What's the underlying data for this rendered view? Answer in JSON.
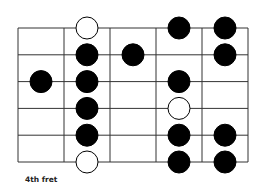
{
  "diagram": {
    "type": "guitar-scale-fretboard",
    "position_label": "4th fret",
    "strings": 6,
    "frets": 5,
    "colors": {
      "line": "#333333",
      "filled": "#000000",
      "open_fill": "#ffffff"
    },
    "dots": [
      {
        "string": 0,
        "fret": 1,
        "style": "open"
      },
      {
        "string": 0,
        "fret": 3,
        "style": "filled"
      },
      {
        "string": 0,
        "fret": 4,
        "style": "filled"
      },
      {
        "string": 1,
        "fret": 1,
        "style": "filled"
      },
      {
        "string": 1,
        "fret": 2,
        "style": "filled"
      },
      {
        "string": 1,
        "fret": 4,
        "style": "filled"
      },
      {
        "string": 2,
        "fret": 0,
        "style": "filled"
      },
      {
        "string": 2,
        "fret": 1,
        "style": "filled"
      },
      {
        "string": 2,
        "fret": 3,
        "style": "filled"
      },
      {
        "string": 3,
        "fret": 1,
        "style": "filled"
      },
      {
        "string": 3,
        "fret": 3,
        "style": "open"
      },
      {
        "string": 4,
        "fret": 1,
        "style": "filled"
      },
      {
        "string": 4,
        "fret": 3,
        "style": "filled"
      },
      {
        "string": 4,
        "fret": 4,
        "style": "filled"
      },
      {
        "string": 5,
        "fret": 1,
        "style": "open"
      },
      {
        "string": 5,
        "fret": 3,
        "style": "filled"
      },
      {
        "string": 5,
        "fret": 4,
        "style": "filled"
      }
    ]
  }
}
